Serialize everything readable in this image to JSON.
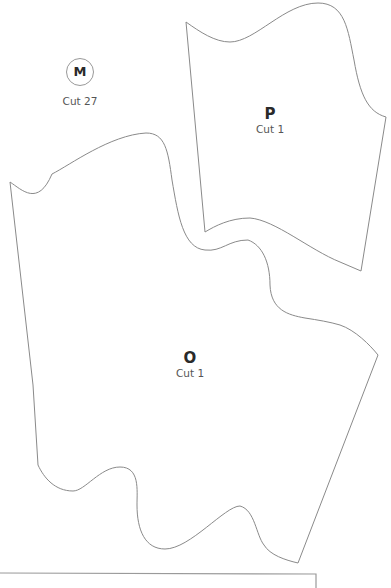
{
  "pattern": {
    "pieces": [
      {
        "id": "M",
        "letter": "M",
        "cut": "Cut 27",
        "style": "circle-badge"
      },
      {
        "id": "P",
        "letter": "P",
        "cut": "Cut 1"
      },
      {
        "id": "O",
        "letter": "O",
        "cut": "Cut 1"
      }
    ],
    "colors": {
      "background": "#ffffff",
      "outline": "#8a8a8a",
      "text": "#2a2a2a"
    }
  }
}
